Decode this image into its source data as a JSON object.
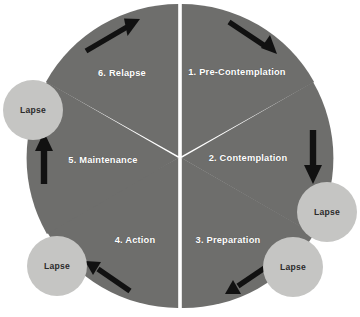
{
  "diagram": {
    "background_color": "#ffffff",
    "wheel": {
      "center": {
        "x": 180,
        "y": 156
      },
      "radius": 152,
      "segment_color": "#6e6e6c",
      "gap_color": "#ffffff",
      "segment_count": 6,
      "label_color": "#ffffff"
    },
    "segments": [
      {
        "number": "1",
        "label": "1. Pre-Contemplation",
        "label_x": 237,
        "label_y": 72
      },
      {
        "number": "2",
        "label": "2. Contemplation",
        "label_x": 248,
        "label_y": 158
      },
      {
        "number": "3",
        "label": "3. Preparation",
        "label_x": 228,
        "label_y": 240
      },
      {
        "number": "4",
        "label": "4. Action",
        "label_x": 135,
        "label_y": 240
      },
      {
        "number": "5",
        "label": "5. Maintenance",
        "label_x": 103,
        "label_y": 160
      },
      {
        "number": "6",
        "label": "6. Relapse",
        "label_x": 122,
        "label_y": 73
      }
    ],
    "lapse_nodes": [
      {
        "label": "Lapse",
        "x": 33,
        "y": 110,
        "r": 30,
        "color": "#c5c5c3",
        "text_color": "#2b2b2b"
      },
      {
        "label": "Lapse",
        "x": 327,
        "y": 212,
        "r": 30,
        "color": "#c5c5c3",
        "text_color": "#2b2b2b"
      },
      {
        "label": "Lapse",
        "x": 293,
        "y": 267,
        "r": 30,
        "color": "#c5c5c3",
        "text_color": "#2b2b2b"
      },
      {
        "label": "Lapse",
        "x": 57,
        "y": 266,
        "r": 30,
        "color": "#c5c5c3",
        "text_color": "#2b2b2b"
      }
    ],
    "arrows": [
      {
        "name": "relapse-to-precontemplation-arrow",
        "direction": "up-right",
        "color": "#111111"
      },
      {
        "name": "precontemplation-to-contemplation-arrow",
        "direction": "down-right",
        "color": "#111111"
      },
      {
        "name": "contemplation-to-lapse-arrow",
        "direction": "down",
        "color": "#111111"
      },
      {
        "name": "preparation-to-action-arrow",
        "direction": "down-left",
        "color": "#111111"
      },
      {
        "name": "action-to-lapse-arrow",
        "direction": "up-left",
        "color": "#111111"
      },
      {
        "name": "maintenance-to-lapse-arrow",
        "direction": "up",
        "color": "#111111"
      }
    ]
  }
}
